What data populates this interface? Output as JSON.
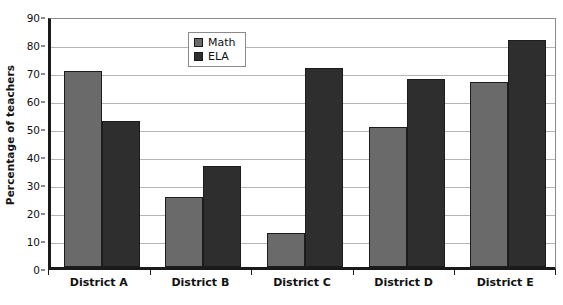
{
  "chart_data": {
    "type": "bar",
    "title": "",
    "subtitle": "",
    "xlabel": "",
    "ylabel": "Percentage of teachers",
    "categories": [
      "District A",
      "District B",
      "District C",
      "District D",
      "District E"
    ],
    "series": [
      {
        "name": "Math",
        "color": "#6a6a6a",
        "values": [
          70,
          25,
          12,
          50,
          66
        ]
      },
      {
        "name": "ELA",
        "color": "#2e2e2e",
        "values": [
          52,
          36,
          71,
          67,
          81
        ]
      }
    ],
    "ylim": [
      0,
      90
    ],
    "ytick_step": 10,
    "yticks": [
      0,
      10,
      20,
      30,
      40,
      50,
      60,
      70,
      80,
      90
    ],
    "ytick_labels": [
      "0",
      "10",
      "20",
      "30",
      "40",
      "50",
      "60",
      "70",
      "80",
      "90"
    ],
    "grid": "horizontal",
    "legend_position": "upper-left-inside",
    "bar_border_color": "#1c1c1c",
    "gridline_color": "#b4b4b4",
    "axis_color": "#1a1a1a",
    "plot_background": "#ffffff"
  },
  "legend": {
    "entries": [
      {
        "label": "Math",
        "swatch": "#6a6a6a"
      },
      {
        "label": "ELA",
        "swatch": "#2e2e2e"
      }
    ]
  }
}
